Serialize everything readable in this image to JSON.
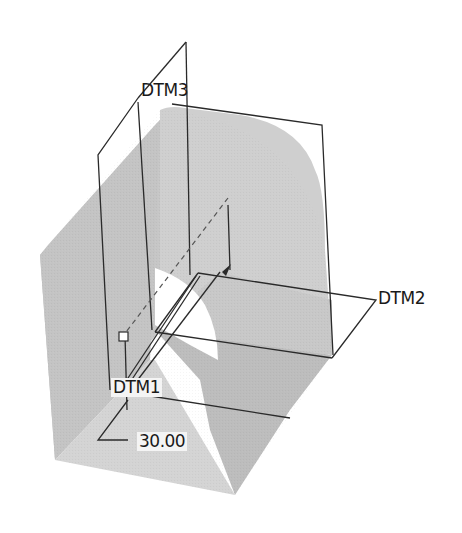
{
  "diagram": {
    "type": "cad-3d-part-with-datum-planes",
    "colors": {
      "background": "#ffffff",
      "solid_light": "#d2d2d2",
      "solid_mid": "#c2c2c2",
      "solid_dark": "#b4b4b4",
      "edge": "#2a2a2a",
      "hole": "#ffffff"
    },
    "datum_planes": [
      {
        "id": "dtm1",
        "label": "DTM1"
      },
      {
        "id": "dtm2",
        "label": "DTM2"
      },
      {
        "id": "dtm3",
        "label": "DTM3"
      }
    ],
    "dimension": {
      "value": "30.00"
    }
  }
}
